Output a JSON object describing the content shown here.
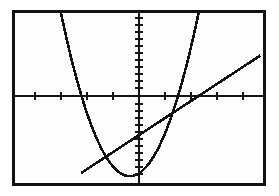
{
  "screen": {
    "device": "graphing-calculator-screen",
    "border_color": "#111111",
    "background_color": "#fdfdfd",
    "ink_color": "#121212"
  },
  "chart_data": {
    "type": "line",
    "title": "",
    "subtitle": "",
    "xlabel": "",
    "ylabel": "",
    "grid": false,
    "legend_position": "none",
    "axes": {
      "x_axis_visible": true,
      "y_axis_visible": true,
      "x_axis_y_value": 0,
      "y_axis_x_value": 0,
      "xlim": [
        -4.7,
        4.7
      ],
      "ylim": [
        -3.1,
        3.1
      ],
      "x_tick_spacing": 1,
      "y_tick_spacing": 0.25,
      "x_tick_values": [
        -4,
        -3,
        -2,
        -1,
        1,
        2,
        3,
        4
      ],
      "y_tick_values": [
        -3,
        -2.75,
        -2.5,
        -2.25,
        -2,
        -1.75,
        -1.5,
        -1.25,
        -1,
        -0.75,
        -0.5,
        -0.25,
        0.25,
        0.5,
        0.75,
        1,
        1.25,
        1.5,
        1.75,
        2,
        2.25,
        2.5,
        2.75,
        3
      ],
      "tick_length_px": 4
    },
    "series": [
      {
        "name": "parabola",
        "kind": "quadratic",
        "equation": "y = 0.9*(x + 0.35)^2 - 2.85",
        "vertex": [
          -0.35,
          -2.85
        ],
        "x": [
          -4.7,
          -4.4,
          -4.1,
          -3.8,
          -3.5,
          -3.2,
          -2.9,
          -2.6,
          -2.3,
          -2.0,
          -1.7,
          -1.4,
          -1.1,
          -0.8,
          -0.5,
          -0.35,
          -0.2,
          0.1,
          0.4,
          0.7,
          1.0,
          1.3,
          1.6,
          1.9,
          2.2,
          2.5,
          2.8,
          3.1,
          3.4
        ],
        "values": [
          13.7,
          11.4,
          9.3,
          7.4,
          5.8,
          4.3,
          3.0,
          1.9,
          1.0,
          0.3,
          -0.3,
          -0.8,
          -1.3,
          -2.0,
          -2.83,
          -2.85,
          -2.83,
          -2.66,
          -2.33,
          -1.85,
          -1.03,
          -0.15,
          0.73,
          1.83,
          3.03,
          4.3,
          5.8,
          7.4,
          9.2
        ]
      },
      {
        "name": "line",
        "kind": "linear",
        "equation": "y = 0.63*x - 1.35",
        "slope": 0.63,
        "intercept": -1.35,
        "x": [
          -2.2,
          4.6
        ],
        "values": [
          -2.74,
          1.55
        ]
      }
    ],
    "intersections": [
      {
        "label": "left-intersection",
        "point": [
          -1.65,
          -2.39
        ]
      },
      {
        "label": "right-intersection",
        "point": [
          2.75,
          0.38
        ]
      }
    ],
    "annotations": []
  }
}
